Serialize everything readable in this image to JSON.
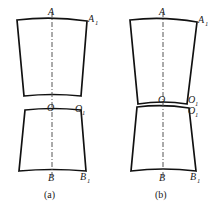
{
  "figure": {
    "type": "technical-line-drawing",
    "background_color": "#ffffff",
    "line_color": "#111111",
    "axis_color": "#555555",
    "panels": [
      {
        "id": "a",
        "caption": "(a)",
        "description": "Two separated trapezoidal segments with a gap at the O-O1 level",
        "labels": {
          "top_center": "A",
          "top_right": "A",
          "top_right_sub": "1",
          "mid_center": "O",
          "mid_right": "O",
          "mid_right_sub": "1",
          "bottom_center": "B",
          "bottom_right": "B",
          "bottom_right_sub": "1"
        }
      },
      {
        "id": "b",
        "caption": "(b)",
        "description": "Two trapezoidal segments meeting at a thin sliver at the O-O1 level",
        "labels": {
          "top_center": "A",
          "top_right": "A",
          "top_right_sub": "1",
          "mid_center": "O",
          "mid_right_upper": "O",
          "mid_right_upper_sub": "1",
          "mid_right_lower": "O",
          "mid_right_lower_sub": "1",
          "bottom_center": "B",
          "bottom_right": "B",
          "bottom_right_sub": "1"
        }
      }
    ]
  }
}
